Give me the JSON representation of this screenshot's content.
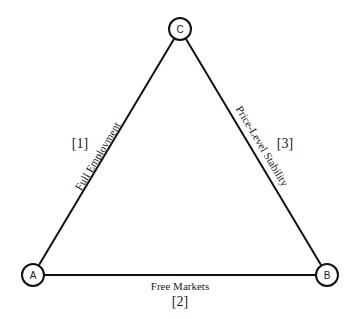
{
  "diagram": {
    "type": "triangle",
    "colors": {
      "line": "#111111",
      "text": "#1a1a1a",
      "background": "#ffffff"
    },
    "nodes": [
      {
        "id": "A",
        "label": "A",
        "x": 33,
        "y": 275
      },
      {
        "id": "B",
        "label": "B",
        "x": 327,
        "y": 275
      },
      {
        "id": "C",
        "label": "C",
        "x": 180,
        "y": 29
      }
    ],
    "edges": [
      {
        "from": "A",
        "to": "C",
        "label": "Full Employment",
        "number": "[1]"
      },
      {
        "from": "A",
        "to": "B",
        "label": "Free Markets",
        "number": "[2]"
      },
      {
        "from": "C",
        "to": "B",
        "label": "Price-Level Stability",
        "number": "[3]"
      }
    ]
  }
}
